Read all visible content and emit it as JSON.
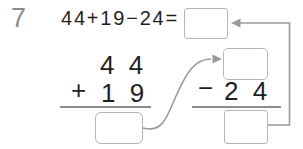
{
  "problem": {
    "number": "7",
    "equation": "44+19−24="
  },
  "answer_box_value": "",
  "addition": {
    "top_operand": "4 4",
    "operator": "+",
    "bottom_operand": "1 9",
    "result_box_value": ""
  },
  "subtraction": {
    "minuend_box_value": "",
    "operator": "−",
    "subtrahend": "2 4",
    "result_box_value": ""
  },
  "arrows": {
    "curve_arrow": "curved-arrow-from-addition-result-to-subtraction-minuend",
    "loop_arrow": "right-angle-arrow-from-subtraction-result-to-answer-box"
  },
  "colors": {
    "background": "#ffffff",
    "text": "#1f1f1f",
    "problem_number": "#8d8d8d",
    "rule_line": "#8c8c8c",
    "arrow": "#9a9a9a",
    "box_border": "#b5b5b5"
  }
}
